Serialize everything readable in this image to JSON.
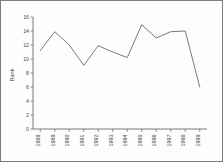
{
  "chart_data": {
    "type": "line",
    "title": "",
    "xlabel": "",
    "ylabel": "Rank",
    "categories": [
      "1988",
      "1989",
      "1990",
      "1991",
      "1992",
      "1993",
      "1994",
      "1995",
      "1996",
      "1997",
      "1998",
      "1999"
    ],
    "values": [
      11.2,
      13.9,
      12.0,
      9.1,
      11.9,
      11.0,
      10.2,
      14.9,
      13.0,
      13.9,
      14.0,
      6.0
    ],
    "ylim": [
      0,
      16
    ],
    "yticks": [
      0,
      2,
      4,
      6,
      8,
      10,
      12,
      14,
      16
    ],
    "ytick_labels": [
      "0",
      "2",
      "4",
      "6",
      "8",
      "10",
      "12",
      "14",
      "16"
    ],
    "grid": false,
    "legend": false,
    "line_color": "#6b6b6b",
    "axis_color": "#6b6b6b",
    "background_color": "#fdfdfd",
    "border_color": "#7d7d7d",
    "xtick_rotation": 90
  }
}
